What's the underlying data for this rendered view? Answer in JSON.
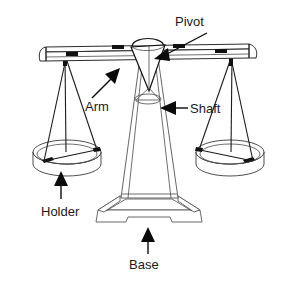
{
  "diagram": {
    "background_color": "#ffffff",
    "line_color": "#2b2b2b",
    "label_color": "#1a1a1a",
    "labels": [
      {
        "id": "pivot",
        "text": "Pivot"
      },
      {
        "id": "arm",
        "text": "Arm"
      },
      {
        "id": "shaft",
        "text": "Shaft"
      },
      {
        "id": "holder",
        "text": "Holder"
      },
      {
        "id": "base",
        "text": "Base"
      }
    ],
    "parts": {
      "pivot": {
        "name": "Pivot",
        "shape": "cone-wedge"
      },
      "arm": {
        "name": "Arm",
        "shape": "horizontal-beam"
      },
      "shaft": {
        "name": "Shaft",
        "shape": "tapered-column"
      },
      "holder_left": {
        "name": "Holder",
        "shape": "elliptical-pan"
      },
      "holder_right": {
        "name": "Holder",
        "shape": "elliptical-pan"
      },
      "base": {
        "name": "Base",
        "shape": "trapezoidal-pedestal"
      }
    }
  }
}
